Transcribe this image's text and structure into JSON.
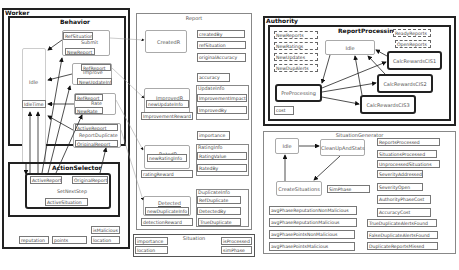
{
  "worker": {
    "title": "Worker",
    "behavior": {
      "title": "Behavior",
      "idle_state": "Idle",
      "idle_time_field": "IdleTime",
      "submit": {
        "label": "Submit",
        "fields": [
          "RefSituation",
          "NewReport"
        ]
      },
      "improve": {
        "label": "Improve",
        "fields": [
          "RefReport",
          "NewUpdateInfo"
        ]
      },
      "rate": {
        "label": "Rate",
        "fields": [
          "RefReport",
          "NewRate"
        ]
      },
      "report_duplicate": {
        "label": "ReportDuplicate",
        "fields": [
          "ActiveReport",
          "OriginalReport"
        ]
      }
    },
    "action_selector": {
      "title": "ActionSelector",
      "set_next_step": {
        "label": "SetNextStep",
        "fields": [
          "ActiveReport",
          "OriginalReport",
          "ActiveSituation"
        ]
      }
    },
    "attributes": [
      "reputation",
      "points",
      "isMalicious",
      "location"
    ]
  },
  "report": {
    "title": "Report",
    "states": {
      "created": {
        "label": "CreatedR"
      },
      "improved": {
        "label": "ImprovedR",
        "field": "newUpdateInfo",
        "reward": "ImprovementReward"
      },
      "rated": {
        "label": "RatedR",
        "field": "newRatingInfo",
        "reward": "ratingReward"
      },
      "detected": {
        "label": "Detected",
        "field": "newDuplicateInfo",
        "reward": "detectionReward"
      }
    },
    "fields": {
      "createdBy": "createdBy",
      "refSituation": "refSituation",
      "originalAccuracy": "originalAccuracy",
      "accuracy": "accuracy",
      "importance": "importance"
    },
    "update_info": {
      "title": "UpdateInfo",
      "fields": [
        "ImprovementImpact",
        "ImprovedBy"
      ]
    },
    "rating_info": {
      "title": "RatingInfo",
      "fields": [
        "RatingValue",
        "RatedBy"
      ]
    },
    "duplicate_info": {
      "title": "DuplicateInfo",
      "fields": [
        "RefDuplicate",
        "DetectedBy",
        "TrueDuplicate"
      ]
    }
  },
  "situation": {
    "title": "Situation",
    "fields": [
      "importance",
      "location",
      "isProcessed",
      "simPhase"
    ]
  },
  "authority": {
    "title": "Authority",
    "report_processing": {
      "title": "ReportProcessing",
      "queues_left": [
        "NewReports",
        "NewRatings",
        "NewUpdates",
        "NewDupAlerts"
      ],
      "queues_right": [
        "ReadyReports",
        "OpenReports"
      ],
      "states": {
        "idle": "Idle",
        "preprocessing": "PreProcessing",
        "calc1": "CalcRewardsCIS1",
        "calc2": "CalcRewardsCIS2",
        "calc3": "CalcRewardsCIS3"
      },
      "cost_field": "cost"
    }
  },
  "situation_generator": {
    "title": "SituationGenerator",
    "states": {
      "idle": "Idle",
      "cleanup": "CleanUpAndStats",
      "create": "CreateSituations"
    },
    "sim_phase": "SimPhase",
    "stats_left": [
      "avgPhaseReputationNonMalicious",
      "avgPhaseReputationMalicious",
      "avgPhasePointsNonMalicious",
      "avgPhasePointsMalicious"
    ],
    "stats_right": [
      "ReportsProcessed",
      "SituationsProcessed",
      "UnprocessedSituations",
      "SeverityAddressed",
      "SeverityOpen",
      "AuthorityPhaseCost",
      "AccuracyCost",
      "TrueDuplicateAlertsFound",
      "FalseDuplicateAlertsFound",
      "DuplicateReportsMissed"
    ]
  }
}
